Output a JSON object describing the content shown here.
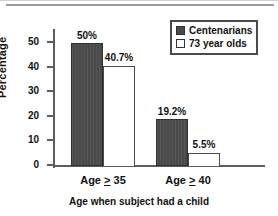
{
  "chart_data": {
    "type": "bar",
    "title": "",
    "xlabel": "Age when subject had a child",
    "ylabel": "Percentage",
    "categories": [
      "Age ≥ 35",
      "Age ≥ 40"
    ],
    "category_labels_parts": [
      {
        "prefix": "Age ",
        "operator": "≥",
        "value": " 35"
      },
      {
        "prefix": "Age ",
        "operator": "≥",
        "value": " 40"
      }
    ],
    "series": [
      {
        "name": "Centenarians",
        "swatch": "dark-square-swatch",
        "color": "#4a4a4a",
        "values": [
          50,
          19.2
        ],
        "value_labels": [
          "50%",
          "19.2%"
        ]
      },
      {
        "name": "73 year olds",
        "swatch": "light-square-swatch",
        "color": "#ffffff",
        "values": [
          40.7,
          5.5
        ],
        "value_labels": [
          "40.7%",
          "5.5%"
        ]
      }
    ],
    "ylim": [
      0,
      55
    ],
    "yticks": [
      0,
      10,
      20,
      30,
      40,
      50
    ],
    "ytick_labels": [
      "0",
      "10",
      "20",
      "30",
      "40",
      "50"
    ],
    "grid": false,
    "legend_position": "top-right"
  },
  "axis": {
    "y_title": "Percentage",
    "x_title": "Age when subject had a child"
  },
  "legend": {
    "entries": [
      {
        "label": "Centenarians"
      },
      {
        "label": "73 year olds"
      }
    ]
  }
}
